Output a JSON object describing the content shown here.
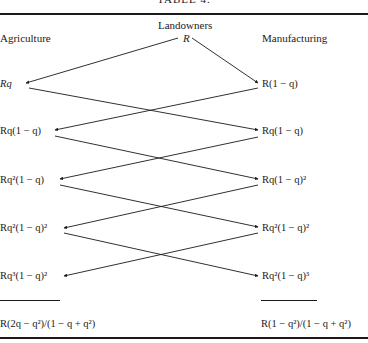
{
  "table": {
    "title": "TABLE 4.",
    "headers": {
      "left": "Agriculture",
      "center": "Landowners",
      "center_value": "R",
      "right": "Manufacturing"
    },
    "rows": [
      {
        "agriculture": "Rq",
        "manufacturing": "R(1 − q)"
      },
      {
        "agriculture": "Rq(1 − q)",
        "manufacturing": "Rq(1 − q)"
      },
      {
        "agriculture": "Rq²(1 − q)",
        "manufacturing": "Rq(1 − q)²"
      },
      {
        "agriculture": "Rq²(1 − q)²",
        "manufacturing": "Rq²(1 − q)²"
      },
      {
        "agriculture": "Rq³(1 − q)²",
        "manufacturing": "Rq²(1 − q)³"
      }
    ],
    "totals": {
      "agriculture": "R(2q − q²)/(1 − q + q²)",
      "manufacturing": "R(1 − q²)/(1 − q + q²)"
    }
  },
  "diagram": {
    "edges": [
      {
        "from": "landowners",
        "to": "agriculture-row-1"
      },
      {
        "from": "landowners",
        "to": "manufacturing-row-1"
      },
      {
        "from": "agriculture-row-1",
        "to": "manufacturing-row-2"
      },
      {
        "from": "manufacturing-row-1",
        "to": "agriculture-row-2"
      },
      {
        "from": "agriculture-row-2",
        "to": "manufacturing-row-3"
      },
      {
        "from": "manufacturing-row-2",
        "to": "agriculture-row-3"
      },
      {
        "from": "agriculture-row-3",
        "to": "manufacturing-row-4"
      },
      {
        "from": "manufacturing-row-3",
        "to": "agriculture-row-4"
      },
      {
        "from": "agriculture-row-4",
        "to": "manufacturing-row-5"
      },
      {
        "from": "manufacturing-row-4",
        "to": "agriculture-row-5"
      }
    ]
  }
}
